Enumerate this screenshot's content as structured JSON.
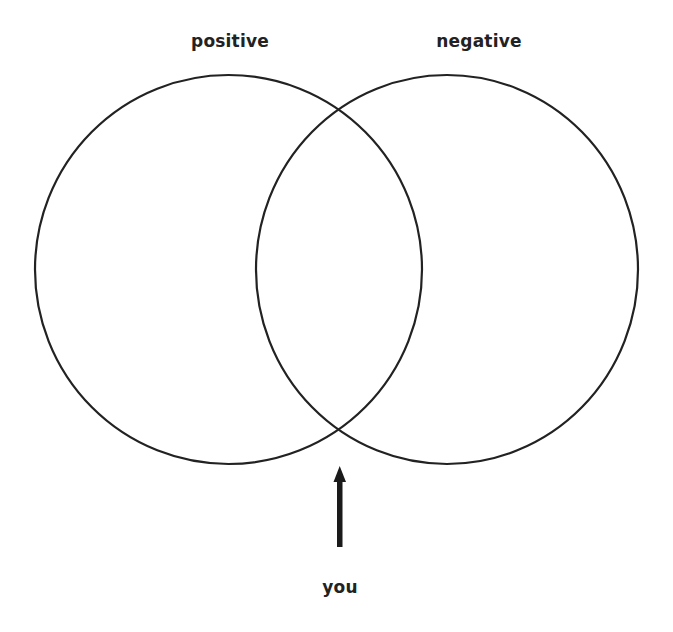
{
  "diagram": {
    "type": "venn",
    "sets": [
      {
        "label": "positive",
        "cx": 228.5,
        "cy": 269.5,
        "rx": 193.5,
        "ry": 194.5
      },
      {
        "label": "negative",
        "cx": 447,
        "cy": 269.5,
        "rx": 191,
        "ry": 194.5
      }
    ],
    "pointer": {
      "label": "you",
      "target": "bottom intersection of both circles"
    },
    "colors": {
      "stroke": "#222222",
      "background": "#ffffff"
    }
  },
  "labels": {
    "left": "positive",
    "right": "negative",
    "pointer": "you"
  }
}
